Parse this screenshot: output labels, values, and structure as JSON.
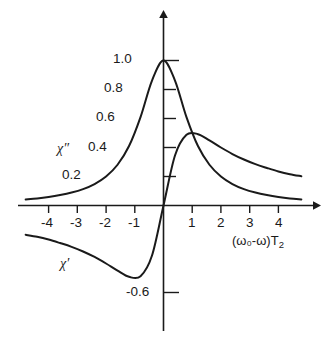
{
  "chart_data": {
    "type": "line",
    "title": "",
    "xlabel": "(ω₀-ω)T₂",
    "ylabel": "",
    "xlim": [
      -4.8,
      4.8
    ],
    "ylim": [
      -0.75,
      1.12
    ],
    "grid": false,
    "legend_position": "inline-annotations",
    "xticks": [
      -4,
      -3,
      -2,
      -1,
      1,
      2,
      3,
      4
    ],
    "xticklabels": [
      "-4",
      "-3",
      "-2",
      "-1",
      "1",
      "2",
      "3",
      "4"
    ],
    "yticks": [
      0.2,
      0.4,
      0.6,
      0.8,
      1.0,
      -0.6
    ],
    "yticklabels": [
      "0.2",
      "0.4",
      "0.6",
      "0.8",
      "1.0",
      "-0.6"
    ],
    "annotations": [
      {
        "text": "χ″",
        "x": -2.7,
        "y": 0.36
      },
      {
        "text": "χ′",
        "x": -2.6,
        "y": -0.42
      }
    ],
    "series": [
      {
        "name": "χ″",
        "description": "Lorentzian absorption lineshape, 1/(1+x^2)",
        "x": [
          -4.8,
          -4.4,
          -4.0,
          -3.6,
          -3.2,
          -2.8,
          -2.4,
          -2.0,
          -1.6,
          -1.2,
          -0.8,
          -0.4,
          0.0,
          0.4,
          0.8,
          1.2,
          1.6,
          2.0,
          2.4,
          2.8,
          3.2,
          3.6,
          4.0,
          4.4,
          4.8
        ],
        "values": [
          0.042,
          0.049,
          0.059,
          0.072,
          0.089,
          0.113,
          0.148,
          0.2,
          0.281,
          0.41,
          0.61,
          0.862,
          1.0,
          0.862,
          0.61,
          0.41,
          0.281,
          0.2,
          0.148,
          0.113,
          0.089,
          0.072,
          0.059,
          0.049,
          0.042
        ]
      },
      {
        "name": "χ′",
        "description": "Lorentzian dispersion lineshape, x/(1+x^2)",
        "x": [
          -4.8,
          -4.4,
          -4.0,
          -3.6,
          -3.2,
          -2.8,
          -2.4,
          -2.0,
          -1.6,
          -1.2,
          -0.8,
          -0.4,
          0.0,
          0.4,
          0.8,
          1.2,
          1.6,
          2.0,
          2.4,
          2.8,
          3.2,
          3.6,
          4.0,
          4.4,
          4.8
        ],
        "values": [
          -0.202,
          -0.216,
          -0.235,
          -0.259,
          -0.285,
          -0.317,
          -0.355,
          -0.4,
          -0.449,
          -0.492,
          -0.488,
          -0.345,
          0.0,
          0.345,
          0.488,
          0.492,
          0.449,
          0.4,
          0.355,
          0.317,
          0.285,
          0.259,
          0.235,
          0.216,
          0.202
        ]
      }
    ]
  },
  "axes": {
    "x_axis_title": "(ω₀-ω)T",
    "x_axis_title_sub": "2",
    "arrow_x": "x-axis-arrow",
    "arrow_y": "y-axis-arrow"
  },
  "ticklabels": {
    "y": [
      {
        "id": "y-1p0",
        "text": "1.0"
      },
      {
        "id": "y-0p8",
        "text": "0.8"
      },
      {
        "id": "y-0p6",
        "text": "0.6"
      },
      {
        "id": "y-0p4",
        "text": "0.4"
      },
      {
        "id": "y-0p2",
        "text": "0.2"
      },
      {
        "id": "y-m0p6",
        "text": "-0.6"
      }
    ],
    "x": [
      {
        "id": "x-m4",
        "text": "-4"
      },
      {
        "id": "x-m3",
        "text": "-3"
      },
      {
        "id": "x-m2",
        "text": "-2"
      },
      {
        "id": "x-m1",
        "text": "-1"
      },
      {
        "id": "x-1",
        "text": "1"
      },
      {
        "id": "x-2",
        "text": "2"
      },
      {
        "id": "x-3",
        "text": "3"
      },
      {
        "id": "x-4",
        "text": "4"
      }
    ]
  },
  "curve_labels": {
    "chi_double_prime": "χ″",
    "chi_prime": "χ′"
  },
  "colors": {
    "ink": "#1a1a1a",
    "background": "#ffffff"
  }
}
